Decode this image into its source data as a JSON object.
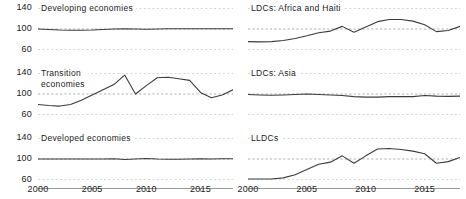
{
  "figure": {
    "background": "#ffffff",
    "line_color": "#3c3c3c",
    "grid_color": "#8c8c8c",
    "axis_color": "#8c8c8c"
  },
  "axis": {
    "y_ticks": [
      "140",
      "100",
      "60"
    ],
    "y_values": [
      140,
      100,
      60
    ],
    "x_ticks": [
      "2000",
      "2005",
      "2010",
      "2015"
    ],
    "x_tick_values": [
      2000,
      2005,
      2010,
      2015
    ],
    "xlim": [
      2000,
      2018
    ],
    "ylim": [
      60,
      140
    ]
  },
  "chart_data": {
    "type": "line",
    "title": "",
    "xlabel": "",
    "ylabel": "",
    "xlim": [
      2000,
      2018
    ],
    "ylim": [
      60,
      140
    ],
    "grid": true,
    "legend": "none",
    "layout": "small-multiples 2 columns x 3 rows",
    "x": [
      2000,
      2001,
      2002,
      2003,
      2004,
      2005,
      2006,
      2007,
      2008,
      2009,
      2010,
      2011,
      2012,
      2013,
      2014,
      2015,
      2016,
      2017,
      2018
    ],
    "panels": [
      {
        "name": "developing-economies",
        "title": "Developing economies",
        "row": 0,
        "col": 0,
        "values": [
          100,
          99,
          98,
          97.5,
          97.5,
          98,
          99,
          100,
          100.5,
          100,
          99.5,
          100,
          100.5,
          100.5,
          100.5,
          100.5,
          100.5,
          100.5,
          100.5
        ]
      },
      {
        "name": "ldcs-africa-and-haiti",
        "title": "LDCs: Africa and Haiti",
        "row": 0,
        "col": 1,
        "values": [
          76,
          75.5,
          76,
          78,
          82,
          87,
          93,
          96,
          105,
          94,
          104,
          114,
          118,
          118,
          115,
          108,
          95,
          97,
          105
        ]
      },
      {
        "name": "transition-economies",
        "title": "Transition\neconomies",
        "row": 1,
        "col": 0,
        "values": [
          80,
          78,
          77,
          80,
          88,
          98,
          108,
          118,
          136,
          100,
          116,
          131,
          132,
          129,
          126,
          103,
          93,
          98,
          108
        ]
      },
      {
        "name": "ldcs-asia",
        "title": "LDCs: Asia",
        "row": 1,
        "col": 1,
        "values": [
          99,
          98,
          97.5,
          98,
          99,
          100,
          99,
          98,
          97,
          95,
          94,
          94,
          95,
          95,
          95,
          97,
          96,
          95.5,
          96
        ]
      },
      {
        "name": "developed-economies",
        "title": "Developed economies",
        "row": 2,
        "col": 0,
        "values": [
          100,
          100,
          100,
          100,
          100,
          100,
          100,
          100.5,
          99,
          100,
          101,
          100,
          99.5,
          99.5,
          100,
          100.5,
          100,
          100.5,
          100.5
        ]
      },
      {
        "name": "lldcs",
        "title": "LLDCs",
        "row": 2,
        "col": 1,
        "values": [
          62,
          62,
          62,
          64,
          70,
          80,
          90,
          94,
          106,
          92,
          106,
          119,
          120,
          118,
          115,
          110,
          92,
          95,
          103
        ]
      }
    ]
  }
}
